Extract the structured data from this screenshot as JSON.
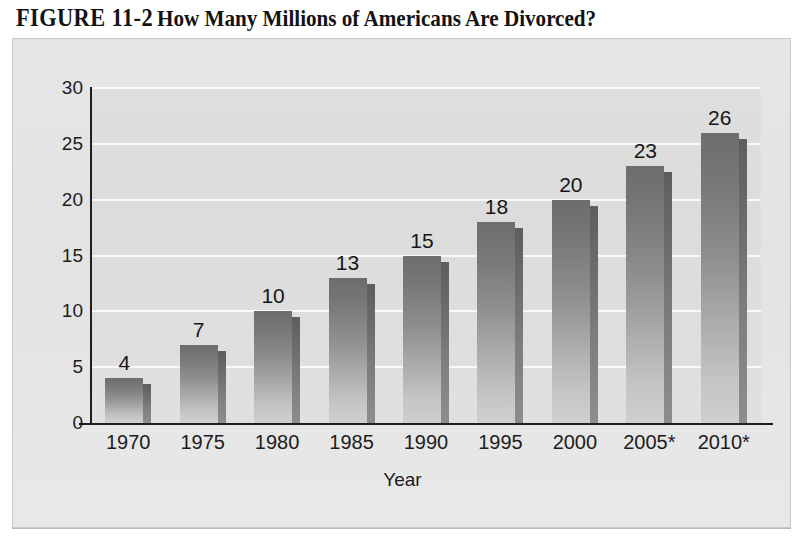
{
  "figure": {
    "number": "FIGURE 11-2",
    "caption": "How Many Millions of Americans Are Divorced?"
  },
  "colors": {
    "panel_background": "#e4e4e4",
    "plot_background": "#dddddd",
    "gridline": "#fafafa",
    "axis_line": "#1e1e1e",
    "bar_top": "#6d6d6d",
    "bar_bottom": "#cfcfcf",
    "bar_shadow": "#6c6c6c",
    "text": "#1c1c1c"
  },
  "chart_data": {
    "type": "bar",
    "title": "How Many Millions of Americans Are Divorced?",
    "categories": [
      "1970",
      "1975",
      "1980",
      "1985",
      "1990",
      "1995",
      "2000",
      "2005*",
      "2010*"
    ],
    "values": [
      4,
      7,
      10,
      13,
      15,
      18,
      20,
      23,
      26
    ],
    "data_labels": [
      "4",
      "7",
      "10",
      "13",
      "15",
      "18",
      "20",
      "23",
      "26"
    ],
    "xlabel": "Year",
    "ylabel": "",
    "ylim": [
      0,
      30
    ],
    "ytick_values": [
      0,
      5,
      10,
      15,
      20,
      25,
      30
    ],
    "ytick_labels": [
      "0",
      "5",
      "10",
      "15",
      "20",
      "25",
      "30"
    ],
    "grid": "horizontal",
    "legend": null,
    "note": "* denotes projected values"
  }
}
